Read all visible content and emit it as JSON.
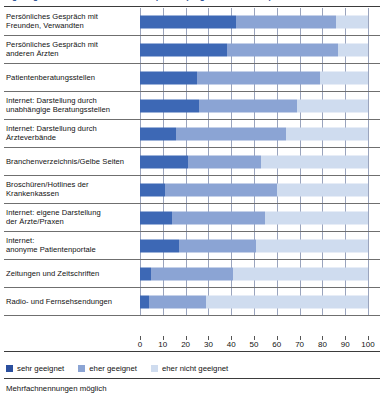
{
  "chart_data": {
    "type": "bar",
    "orientation": "horizontal",
    "stacked": true,
    "title": "Eignung verschiedener Informationsquellen (Angaben in Prozent)",
    "xlabel": "",
    "ylabel": "",
    "xlim": [
      0,
      100
    ],
    "xticks": [
      0,
      10,
      20,
      30,
      40,
      50,
      60,
      70,
      80,
      90,
      100
    ],
    "xtick_labels": [
      "0",
      "10",
      "20",
      "30",
      "40",
      "50",
      "60",
      "70",
      "80",
      "90",
      "100"
    ],
    "grid": true,
    "legend_position": "bottom-left",
    "footnote": "Mehrfachnennungen möglich",
    "categories": [
      "Persönliches Gespräch mit Freunden, Verwandten",
      "Persönliches Gespräch mit anderen Ärzten",
      "Patientenberatungsstellen",
      "Internet: Darstellung durch unabhängige Beratungsstellen",
      "Internet: Darstellung durch Ärzteverbände",
      "Branchenverzeichnis/Gelbe Seiten",
      "Broschüren/Hotlines der Krankenkassen",
      "Internet: eigene Darstellung der Ärzte/Praxen",
      "Internet: anonyme Patientenportale",
      "Zeitungen und Zeitschriften",
      "Radio- und Fernsehsendungen"
    ],
    "category_lines": [
      [
        "Persönliches Gespräch mit",
        "Freunden, Verwandten"
      ],
      [
        "Persönliches Gespräch mit",
        "anderen Ärzten"
      ],
      [
        "Patientenberatungsstellen"
      ],
      [
        "Internet: Darstellung durch",
        "unabhängige Beratungsstellen"
      ],
      [
        "Internet: Darstellung durch",
        "Ärzteverbände"
      ],
      [
        "Branchenverzeichnis/Gelbe Seiten"
      ],
      [
        "Broschüren/Hotlines der",
        "Krankenkassen"
      ],
      [
        "Internet: eigene Darstellung",
        "der Ärzte/Praxen"
      ],
      [
        "Internet:",
        "anonyme Patientenportale"
      ],
      [
        "Zeitungen und Zeitschriften"
      ],
      [
        "Radio- und Fernsehsendungen"
      ]
    ],
    "series": [
      {
        "name": "sehr geeignet",
        "color": "#2b4f9e",
        "values": [
          42,
          38,
          25,
          26,
          16,
          21,
          11,
          14,
          17,
          5,
          4
        ]
      },
      {
        "name": "eher geeignet",
        "color": "#8ba4d4",
        "values": [
          44,
          49,
          54,
          43,
          48,
          32,
          49,
          41,
          34,
          36,
          25
        ]
      },
      {
        "name": "eher nicht geeignet",
        "color": "#cfdcef",
        "values": [
          14,
          13,
          21,
          31,
          36,
          47,
          40,
          45,
          49,
          59,
          71
        ]
      }
    ],
    "cumulative_ends": [
      [
        42,
        86,
        100
      ],
      [
        38,
        87,
        100
      ],
      [
        25,
        79,
        100
      ],
      [
        26,
        69,
        100
      ],
      [
        16,
        64,
        100
      ],
      [
        21,
        53,
        100
      ],
      [
        11,
        60,
        100
      ],
      [
        14,
        55,
        100
      ],
      [
        17,
        51,
        100
      ],
      [
        5,
        41,
        100
      ],
      [
        4,
        29,
        100
      ]
    ]
  },
  "legend": {
    "items": [
      {
        "label": "sehr geeignet"
      },
      {
        "label": "eher geeignet"
      },
      {
        "label": "eher nicht geeignet"
      }
    ]
  },
  "footer": {
    "note": "Mehrfachnennungen möglich"
  }
}
